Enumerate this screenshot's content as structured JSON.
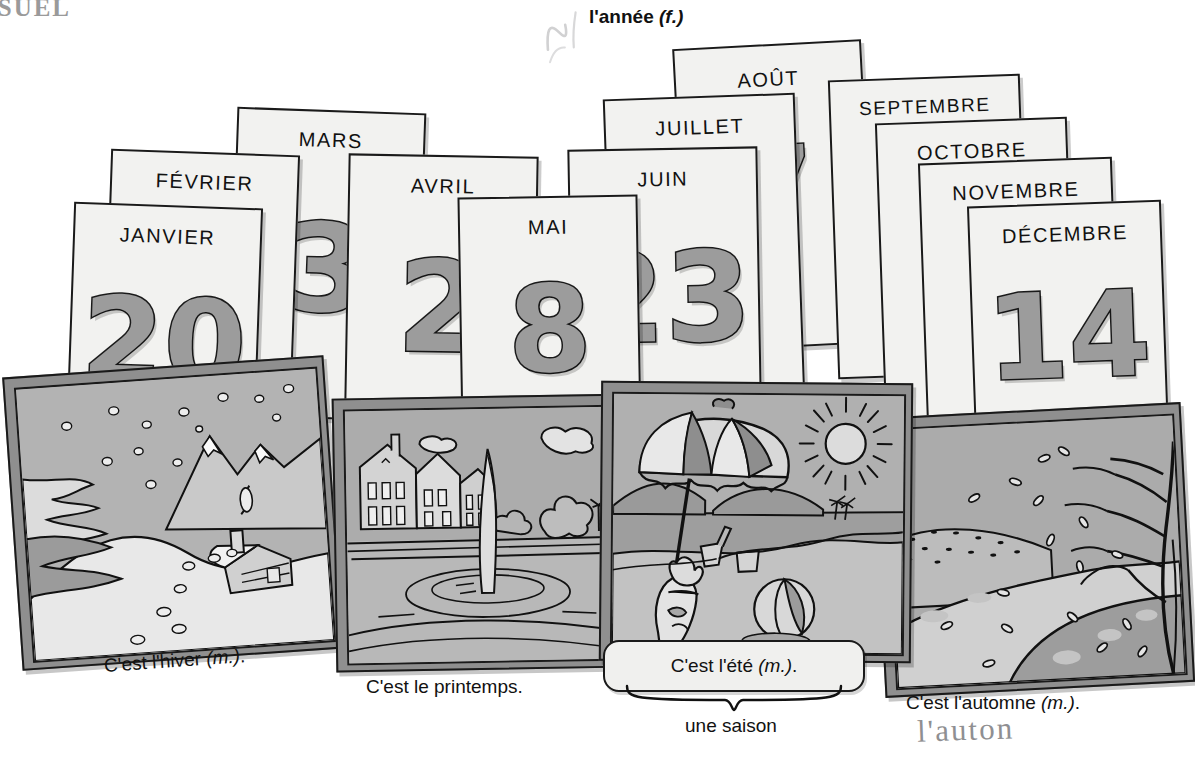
{
  "page": {
    "marker": "ISUEL",
    "year_label": "l'année",
    "year_gender": "(f.)"
  },
  "handwriting": [
    {
      "name": "pencil-scribble-top",
      "text": "✓"
    },
    {
      "name": "pencil-mark-juillet",
      "text": "✡"
    },
    {
      "name": "pencil-note-automne",
      "text": "l'auton"
    }
  ],
  "calendar": {
    "cards": [
      {
        "month": "JANVIER",
        "number": "20"
      },
      {
        "month": "FÉVRIER",
        "number": ""
      },
      {
        "month": "MARS",
        "number": "3"
      },
      {
        "month": "AVRIL",
        "number": "2"
      },
      {
        "month": "MAI",
        "number": "8"
      },
      {
        "month": "JUIN",
        "number": "23"
      },
      {
        "month": "JUILLET",
        "number": ""
      },
      {
        "month": "AOÛT",
        "number": "7"
      },
      {
        "month": "SEPTEMBRE",
        "number": ""
      },
      {
        "month": "OCTOBRE",
        "number": ""
      },
      {
        "month": "NOVEMBRE",
        "number": ""
      },
      {
        "month": "DÉCEMBRE",
        "number": "14"
      }
    ]
  },
  "seasons": {
    "callout_label": "une saison",
    "items": [
      {
        "key": "hiver",
        "caption": "C'est l'hiver",
        "gender": "(m.)",
        "scene": "snowy-mountain-cabin",
        "scene_elements": [
          "snowflakes",
          "mountains",
          "pine-trees",
          "log-cabin",
          "snow-drifts"
        ]
      },
      {
        "key": "printemps",
        "caption": "C'est le printemps.",
        "gender": "",
        "scene": "city-park-fountain",
        "scene_elements": [
          "buildings",
          "fountain",
          "pond-ripples",
          "clouds",
          "trees"
        ]
      },
      {
        "key": "ete",
        "caption": "C'est l'été",
        "gender": "(m.)",
        "scene": "beach-umbrella",
        "scene_elements": [
          "beach-umbrella",
          "sun",
          "dog",
          "beach-ball",
          "bucket",
          "shovel",
          "sea",
          "palm-trees"
        ]
      },
      {
        "key": "automne",
        "caption": "C'est l'automne",
        "gender": "(m.)",
        "scene": "falling-leaves-path",
        "scene_elements": [
          "bare-tree",
          "falling-leaves",
          "path",
          "hills"
        ]
      }
    ]
  },
  "colors": {
    "ink": "#1a1a1a",
    "paper": "#f2f2f0",
    "card_number_fill": "#9c9c9c",
    "photo_frame": "#8f8f8f",
    "photo_sky": "#b7b7b7",
    "pencil": "#a9a9ad"
  }
}
